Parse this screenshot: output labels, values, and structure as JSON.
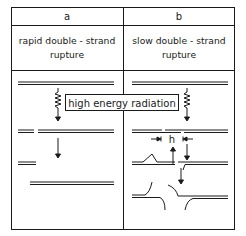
{
  "columns": [
    {
      "id": "a",
      "header": "a",
      "title_line1": "rapid double - strand",
      "title_line2": "rupture"
    },
    {
      "id": "b",
      "header": "b",
      "title_line1": "slow double - strand",
      "title_line2": "rupture"
    }
  ],
  "radiation_label": "high energy radiation",
  "gap_label": "h",
  "colors": {
    "line": "#1a1a1a",
    "background": "#ffffff"
  }
}
